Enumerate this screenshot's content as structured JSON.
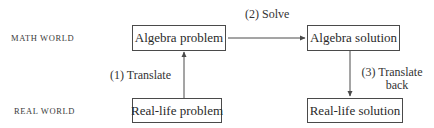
{
  "diagram": {
    "type": "flowchart",
    "rows": {
      "math": {
        "label": "MATH WORLD"
      },
      "real": {
        "label": "REAL WORLD"
      }
    },
    "nodes": [
      {
        "id": "algebra-problem",
        "label": "Algebra problem",
        "row": "math"
      },
      {
        "id": "algebra-solution",
        "label": "Algebra solution",
        "row": "math"
      },
      {
        "id": "real-life-problem",
        "label": "Real-life problem",
        "row": "real"
      },
      {
        "id": "real-life-solution",
        "label": "Real-life solution",
        "row": "real"
      }
    ],
    "edges": [
      {
        "from": "real-life-problem",
        "to": "algebra-problem",
        "step": "(1)",
        "label": "Translate"
      },
      {
        "from": "algebra-problem",
        "to": "algebra-solution",
        "step": "(2)",
        "label": "Solve"
      },
      {
        "from": "algebra-solution",
        "to": "real-life-solution",
        "step": "(3)",
        "label": "Translate back",
        "label_lines": [
          "(3)  Translate",
          "back"
        ]
      }
    ],
    "edge_labels": {
      "translate": "(1)  Translate",
      "solve": "(2)  Solve",
      "translate_back_line1": "(3)  Translate",
      "translate_back_line2": "back"
    },
    "colors": {
      "line": "#4a4a4a",
      "text": "#2a2a2a",
      "background": "#ffffff"
    }
  }
}
